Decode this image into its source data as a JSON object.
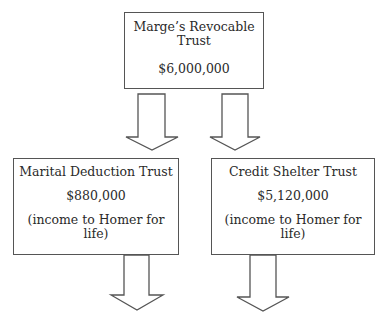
{
  "diagram": {
    "top_box": {
      "title_line1": "Marge’s Revocable",
      "title_line2": "Trust",
      "amount": "$6,000,000"
    },
    "left_box": {
      "title": "Marital Deduction Trust",
      "amount": "$880,000",
      "note_line1": "(income to Homer for",
      "note_line2": "life)"
    },
    "right_box": {
      "title": "Credit Shelter Trust",
      "amount": "$5,120,000",
      "note_line1": "(income to Homer for",
      "note_line2": "life)"
    },
    "arrows": [
      {
        "from": "top_box",
        "to": "left_box",
        "icon": "down-arrow-icon"
      },
      {
        "from": "top_box",
        "to": "right_box",
        "icon": "down-arrow-icon"
      },
      {
        "from": "left_box",
        "to": "below",
        "icon": "down-arrow-icon"
      },
      {
        "from": "right_box",
        "to": "below",
        "icon": "down-arrow-icon"
      }
    ],
    "colors": {
      "stroke": "#555555",
      "text": "#2a2a2a",
      "background": "#ffffff"
    }
  }
}
